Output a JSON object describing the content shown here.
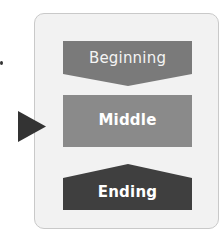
{
  "diagram": {
    "stages": [
      {
        "id": "beginning",
        "label": "Beginning",
        "shape": "down-arrow-pentagon",
        "color": "#7a7a7a"
      },
      {
        "id": "middle",
        "label": "Middle",
        "shape": "rectangle",
        "color": "#8a8a8a"
      },
      {
        "id": "ending",
        "label": "Ending",
        "shape": "up-arrow-pentagon",
        "color": "#3f3f3f"
      }
    ],
    "pointer": {
      "target": "middle",
      "icon": "triangle-right-icon",
      "color": "#333333"
    },
    "frame": {
      "background": "#f2f2f2",
      "border": "#c9c9c9"
    }
  }
}
